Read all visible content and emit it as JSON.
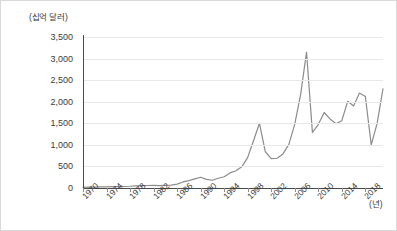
{
  "chart_data": {
    "type": "line",
    "title": "",
    "ylabel": "(십억 달러)",
    "xlabel": "(년)",
    "ylim": [
      0,
      3500
    ],
    "ytick_labels": [
      "3,500",
      "3,000",
      "2,500",
      "2,000",
      "1,500",
      "1,000",
      "500",
      "0"
    ],
    "ytick_values": [
      3500,
      3000,
      2500,
      2000,
      1500,
      1000,
      500,
      0
    ],
    "xtick_labels": [
      "1970",
      "1974",
      "1978",
      "1982",
      "1986",
      "1990",
      "1994",
      "1998",
      "2002",
      "2006",
      "2010",
      "2014",
      "2018"
    ],
    "xtick_values": [
      1970,
      1974,
      1978,
      1982,
      1986,
      1990,
      1994,
      1998,
      2002,
      2006,
      2010,
      2014,
      2018
    ],
    "xlim": [
      1970,
      2021
    ],
    "grid": true,
    "legend": "none",
    "line_color": "#8c8c8c",
    "grid_color": "#e8e8e8",
    "axis_color": "#4a4a4a",
    "x": [
      1970,
      1971,
      1972,
      1973,
      1974,
      1975,
      1976,
      1977,
      1978,
      1979,
      1980,
      1981,
      1982,
      1983,
      1984,
      1985,
      1986,
      1987,
      1988,
      1989,
      1990,
      1991,
      1992,
      1993,
      1994,
      1995,
      1996,
      1997,
      1998,
      1999,
      2000,
      2001,
      2002,
      2003,
      2004,
      2005,
      2006,
      2007,
      2008,
      2009,
      2010,
      2011,
      2012,
      2013,
      2014,
      2015,
      2016,
      2017,
      2018,
      2019,
      2020,
      2021
    ],
    "values": [
      15,
      18,
      20,
      25,
      28,
      30,
      32,
      35,
      40,
      50,
      55,
      58,
      60,
      55,
      60,
      65,
      90,
      140,
      170,
      210,
      250,
      200,
      180,
      225,
      260,
      350,
      400,
      490,
      710,
      1100,
      1500,
      840,
      680,
      690,
      790,
      1010,
      1480,
      2170,
      3150,
      1290,
      1470,
      1750,
      1600,
      1490,
      1560,
      2010,
      1900,
      2200,
      2120,
      1000,
      1500,
      2300
    ],
    "series_name": "FDI inflows"
  }
}
